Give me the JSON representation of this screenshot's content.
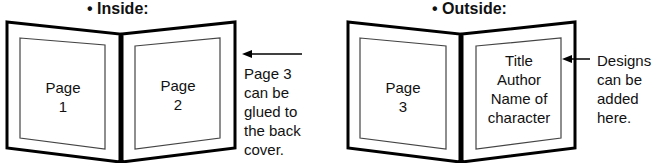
{
  "inside": {
    "heading": "• Inside:",
    "page_left": {
      "line1": "Page",
      "line2": "1"
    },
    "page_right": {
      "line1": "Page",
      "line2": "2"
    },
    "note": [
      "Page 3",
      "can be",
      "glued to",
      "the back",
      "cover."
    ]
  },
  "outside": {
    "heading": "• Outside:",
    "page_left": {
      "line1": "Page",
      "line2": "3"
    },
    "page_right": [
      "Title",
      "Author",
      "Name of",
      "character"
    ],
    "note": [
      "Designs",
      "can be",
      "added",
      "here."
    ]
  }
}
